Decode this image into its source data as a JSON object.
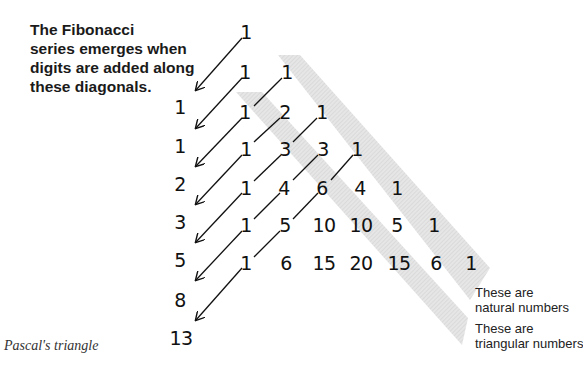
{
  "caption": {
    "lines": [
      "The Fibonacci",
      "series emerges when",
      "digits are added along",
      "these diagonals."
    ]
  },
  "figure_title": "Pascal's triangle",
  "labels": {
    "natural": [
      "These are",
      "natural numbers"
    ],
    "triangular": [
      "These are",
      "triangular numbers"
    ]
  },
  "colors": {
    "band": "#dcdcdc",
    "text": "#111111",
    "arrow": "#111111"
  },
  "triangle": {
    "rows": [
      [
        "1"
      ],
      [
        "1",
        "1"
      ],
      [
        "1",
        "2",
        "1"
      ],
      [
        "1",
        "3",
        "3",
        "1"
      ],
      [
        "1",
        "4",
        "6",
        "4",
        "1"
      ],
      [
        "1",
        "5",
        "10",
        "10",
        "5",
        "1"
      ],
      [
        "1",
        "6",
        "15",
        "20",
        "15",
        "6",
        "1"
      ]
    ]
  },
  "fibonacci": [
    "1",
    "1",
    "2",
    "3",
    "5",
    "8",
    "13"
  ]
}
